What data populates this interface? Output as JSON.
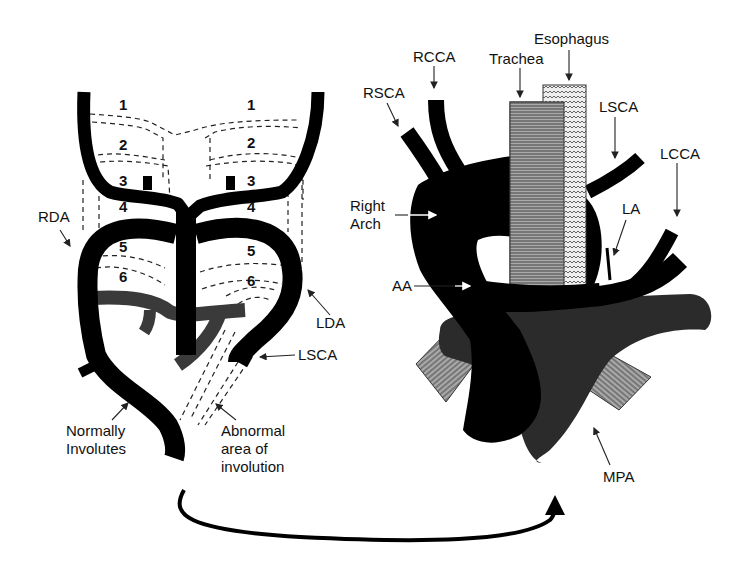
{
  "left_panel": {
    "arch_numbers": [
      "1",
      "2",
      "3",
      "4",
      "5",
      "6"
    ],
    "labels": {
      "rda": "RDA",
      "lda": "LDA",
      "lsca": "LSCA",
      "normally_involutes_line1": "Normally",
      "normally_involutes_line2": "Involutes",
      "abnormal_line1": "Abnormal",
      "abnormal_line2": "area of",
      "abnormal_line3": "involution"
    }
  },
  "right_panel": {
    "labels": {
      "rcca": "RCCA",
      "rsca": "RSCA",
      "trachea": "Trachea",
      "esophagus": "Esophagus",
      "lsca": "LSCA",
      "lcca": "LCCA",
      "right_arch_line1": "Right",
      "right_arch_line2": "Arch",
      "la": "LA",
      "aa": "AA",
      "mpa": "MPA"
    }
  },
  "colors": {
    "vessel": "#000000",
    "pulmonary": "#2b2b2b",
    "trachea_fill": "#8a8a8a",
    "esophagus_fill": "#d8d8d8",
    "background": "#ffffff"
  }
}
